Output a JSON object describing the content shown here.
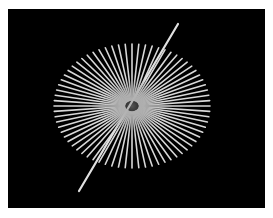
{
  "image": {
    "description": "Radial line resolution target (Siemens-star style) on black background",
    "background_color": "#000000",
    "page_color": "#ffffff",
    "line_color": "#d8d8d8"
  },
  "star": {
    "center": [
      132,
      106
    ],
    "radius_x": 78,
    "radius_y": 62,
    "ray_count": 72,
    "long_rays": [
      {
        "from": [
          178,
          24
        ],
        "to": [
          79,
          191
        ]
      }
    ]
  }
}
